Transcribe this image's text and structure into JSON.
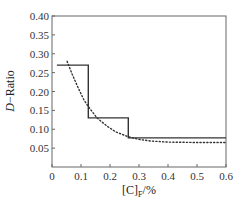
{
  "chart_data": {
    "type": "line",
    "title": "",
    "xlabel": "[C]_F/%",
    "xlabel_main": "[C]",
    "xlabel_sub": "F",
    "xlabel_suffix": "/%",
    "ylabel": "D−Ratio",
    "ylabel_italic": "D",
    "ylabel_suffix": "−Ratio",
    "xlim": [
      0,
      0.6
    ],
    "ylim": [
      0,
      0.4
    ],
    "xticks": [
      0,
      0.1,
      0.2,
      0.3,
      0.4,
      0.5,
      0.6
    ],
    "xtick_labels": [
      "0",
      "0.1",
      "0.2",
      "0.3",
      "0.4",
      "0.5",
      "0.6"
    ],
    "yticks": [
      0.05,
      0.1,
      0.15,
      0.2,
      0.25,
      0.3,
      0.35,
      0.4
    ],
    "ytick_labels": [
      "0.05",
      "0.10",
      "0.15",
      "0.20",
      "0.25",
      "0.30",
      "0.35",
      "0.40"
    ],
    "grid": false,
    "legend": null,
    "series": [
      {
        "name": "step",
        "style": "solid",
        "color": "#333333",
        "x": [
          0.017,
          0.125,
          0.125,
          0.263,
          0.263,
          0.6
        ],
        "y": [
          0.27,
          0.27,
          0.13,
          0.13,
          0.077,
          0.077
        ]
      },
      {
        "name": "fit",
        "style": "dotted",
        "color": "#333333",
        "x": [
          0.052,
          0.07,
          0.09,
          0.11,
          0.125,
          0.155,
          0.19,
          0.22,
          0.263,
          0.3,
          0.34,
          0.4,
          0.5,
          0.6
        ],
        "y": [
          0.28,
          0.245,
          0.21,
          0.178,
          0.16,
          0.13,
          0.108,
          0.093,
          0.08,
          0.073,
          0.069,
          0.066,
          0.065,
          0.065
        ]
      }
    ]
  }
}
